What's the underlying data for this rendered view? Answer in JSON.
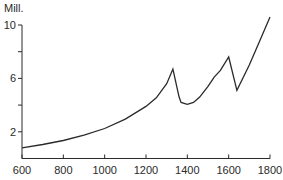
{
  "chart_data": {
    "type": "line",
    "title": "",
    "xlabel": "",
    "ylabel": "Mill.",
    "xlim": [
      600,
      1800
    ],
    "ylim": [
      0,
      10
    ],
    "grid": false,
    "legend": null,
    "x_ticks": [
      600,
      800,
      1000,
      1200,
      1400,
      1600,
      1800
    ],
    "x_tick_labels": [
      "600",
      "800",
      "1000",
      "1200",
      "1400",
      "1600",
      "1800"
    ],
    "y_ticks": [
      2,
      4,
      6,
      8,
      10
    ],
    "y_tick_labels": [
      "2",
      "",
      "6",
      "",
      "10"
    ],
    "series": [
      {
        "name": "Population",
        "x": [
          600,
          700,
          800,
          900,
          1000,
          1100,
          1200,
          1250,
          1300,
          1330,
          1360,
          1370,
          1400,
          1430,
          1460,
          1500,
          1530,
          1560,
          1600,
          1640,
          1700,
          1750,
          1800
        ],
        "values": [
          0.8,
          1.05,
          1.35,
          1.75,
          2.25,
          2.95,
          3.9,
          4.55,
          5.6,
          6.7,
          4.6,
          4.2,
          4.06,
          4.2,
          4.6,
          5.4,
          6.1,
          6.6,
          7.6,
          5.1,
          7.0,
          8.8,
          10.6
        ]
      }
    ]
  }
}
